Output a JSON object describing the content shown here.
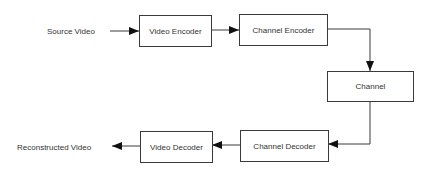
{
  "diagram": {
    "type": "block-diagram",
    "title": "",
    "colors": {
      "stroke": "#3a3a3a",
      "text": "#333333",
      "background": "#ffffff"
    },
    "labels": {
      "source": "Source Video",
      "sink": "Reconstructed Video"
    },
    "nodes": [
      {
        "id": "video_encoder",
        "label": "Video Encoder"
      },
      {
        "id": "channel_encoder",
        "label": "Channel Encoder"
      },
      {
        "id": "channel",
        "label": "Channel"
      },
      {
        "id": "channel_decoder",
        "label": "Channel Decoder"
      },
      {
        "id": "video_decoder",
        "label": "Video Decoder"
      }
    ],
    "edges": [
      {
        "from": "Source Video",
        "to": "video_encoder"
      },
      {
        "from": "video_encoder",
        "to": "channel_encoder"
      },
      {
        "from": "channel_encoder",
        "to": "channel"
      },
      {
        "from": "channel",
        "to": "channel_decoder"
      },
      {
        "from": "channel_decoder",
        "to": "video_decoder"
      },
      {
        "from": "video_decoder",
        "to": "Reconstructed Video"
      }
    ]
  }
}
